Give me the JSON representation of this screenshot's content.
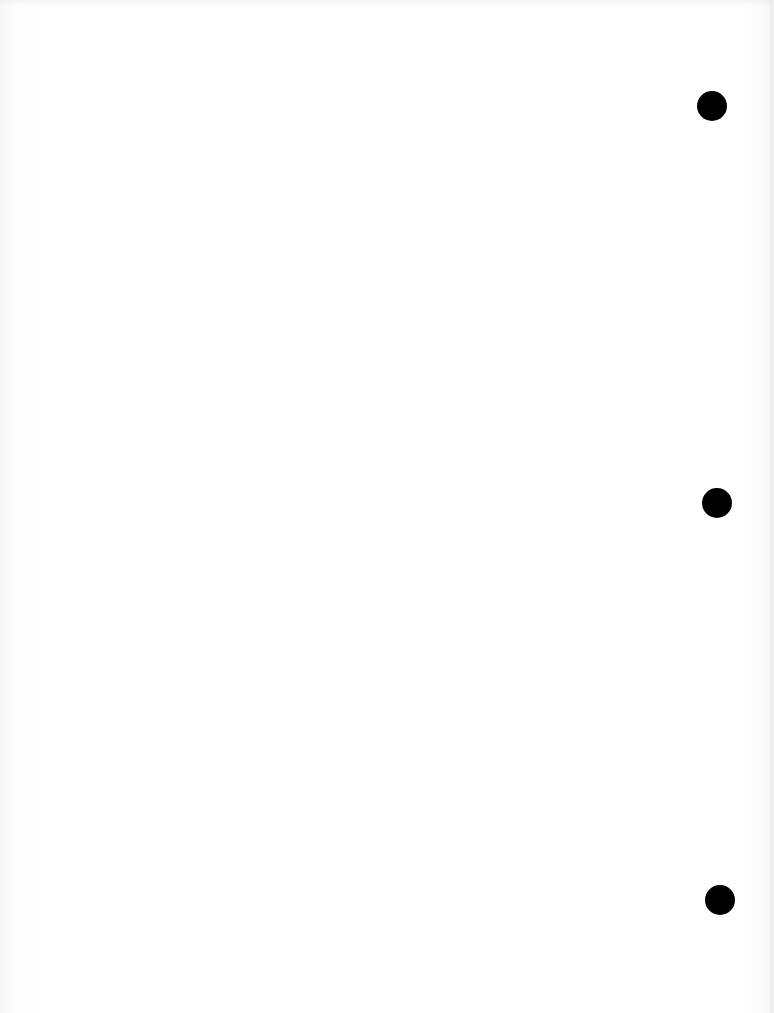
{
  "document": {
    "type": "blank scanned page",
    "background_color": "#ffffff",
    "holes": [
      {
        "name": "hole-punch-top",
        "cx": 712,
        "cy": 106,
        "r": 15
      },
      {
        "name": "hole-punch-middle",
        "cx": 717,
        "cy": 503,
        "r": 15
      },
      {
        "name": "hole-punch-bottom",
        "cx": 720,
        "cy": 900,
        "r": 15
      }
    ],
    "hole_color": "#000000"
  }
}
